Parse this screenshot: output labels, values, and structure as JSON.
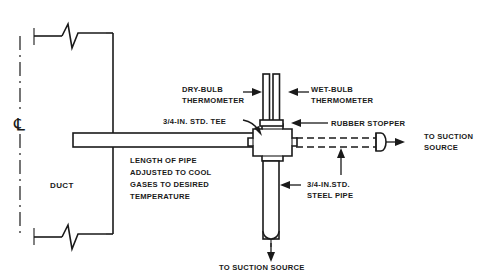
{
  "figure": {
    "line_color": "#1a1a1a",
    "background_color": "#ffffff"
  },
  "labels": {
    "dry_bulb_line1": "DRY-BULB",
    "dry_bulb_line2": "THERMOMETER",
    "wet_bulb_line1": "WET-BULB",
    "wet_bulb_line2": "THERMOMETER",
    "tee": "3/4-IN. STD. TEE",
    "rubber_stopper": "RUBBER STOPPER",
    "to_suction_right_line1": "TO SUCTION",
    "to_suction_right_line2": "SOURCE",
    "steel_pipe_line1": "3/4-IN.STD.",
    "steel_pipe_line2": "STEEL PIPE",
    "length_note_line1": "LENGTH OF PIPE",
    "length_note_line2": "ADJUSTED TO COOL",
    "length_note_line3": "GASES TO DESIRED",
    "length_note_line4": "TEMPERATURE",
    "duct": "DUCT",
    "to_suction_bottom": "TO SUCTION SOURCE",
    "centerline_symbol": "℄"
  },
  "components": [
    {
      "name": "duct",
      "label": "DUCT"
    },
    {
      "name": "duct-centerline",
      "label": "℄"
    },
    {
      "name": "horizontal-sample-pipe",
      "label": "LENGTH OF PIPE ADJUSTED TO COOL GASES TO DESIRED TEMPERATURE"
    },
    {
      "name": "std-tee",
      "label": "3/4-IN. STD. TEE"
    },
    {
      "name": "dry-bulb-thermometer",
      "label": "DRY-BULB THERMOMETER"
    },
    {
      "name": "wet-bulb-thermometer",
      "label": "WET-BULB THERMOMETER"
    },
    {
      "name": "rubber-stopper",
      "label": "RUBBER STOPPER"
    },
    {
      "name": "steel-pipe",
      "label": "3/4-IN.STD. STEEL PIPE"
    },
    {
      "name": "suction-hose-right",
      "label": "TO SUCTION SOURCE"
    },
    {
      "name": "suction-outlet-bottom",
      "label": "TO SUCTION SOURCE"
    }
  ]
}
